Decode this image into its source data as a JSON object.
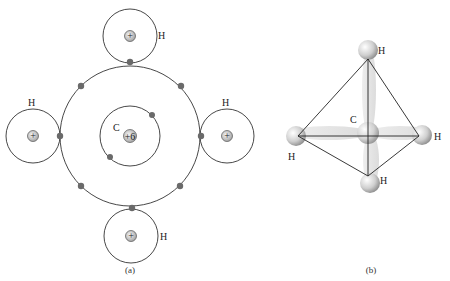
{
  "panel_a": {
    "caption": "(a)",
    "carbon": {
      "label": "C",
      "nucleus_charge": "+6"
    },
    "hydrogens": [
      {
        "label": "H",
        "position": "top",
        "nucleus": "+"
      },
      {
        "label": "H",
        "position": "left",
        "nucleus": "+"
      },
      {
        "label": "H",
        "position": "right",
        "nucleus": "+"
      },
      {
        "label": "H",
        "position": "bottom",
        "nucleus": "+"
      }
    ]
  },
  "panel_b": {
    "caption": "(b)",
    "carbon": {
      "label": "C"
    },
    "hydrogens": [
      {
        "label": "H",
        "position": "top"
      },
      {
        "label": "H",
        "position": "left"
      },
      {
        "label": "H",
        "position": "right"
      },
      {
        "label": "H",
        "position": "bottom"
      }
    ]
  },
  "colors": {
    "line": "#333333",
    "electron": "#6a6a6a",
    "nucleus_fill": "#d8d8d8"
  }
}
